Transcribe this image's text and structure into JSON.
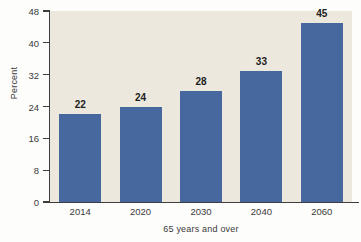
{
  "chart_data": {
    "type": "bar",
    "title": "",
    "xlabel": "65 years and over",
    "ylabel": "Percent",
    "categories": [
      "2014",
      "2020",
      "2030",
      "2040",
      "2060"
    ],
    "values": [
      22,
      24,
      28,
      33,
      45
    ],
    "value_labels": [
      "22",
      "24",
      "28",
      "33",
      "45"
    ],
    "ylim": [
      0,
      48
    ],
    "yticks": [
      0,
      8,
      16,
      24,
      32,
      40,
      48
    ],
    "ytick_labels": [
      "0",
      "8",
      "16",
      "24",
      "32",
      "40",
      "48"
    ],
    "grid": false,
    "legend": null,
    "series": [
      {
        "name": "Percent",
        "values": [
          22,
          24,
          28,
          33,
          45
        ]
      }
    ],
    "colors": {
      "bar": "#47689e",
      "plot_background": "#ece8dd",
      "figure_background": "#fdfdfc",
      "axis": "#3d3d3d",
      "tick_text": "#3a3a3a",
      "value_text": "#1d1d1d"
    }
  }
}
